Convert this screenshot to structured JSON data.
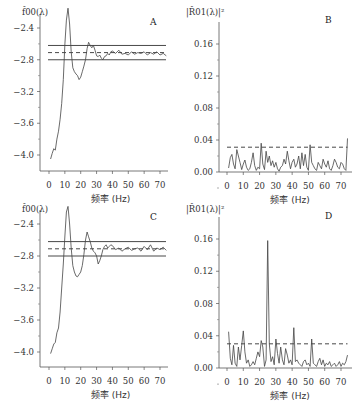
{
  "chart_data": [
    {
      "panel": "A",
      "type": "line",
      "ylabel": "f̂00(λ)",
      "xlabel": "频率 (Hz)",
      "xticks": [
        0,
        10,
        20,
        30,
        40,
        50,
        60,
        70
      ],
      "yticks": [
        -2.4,
        -2.8,
        -3.2,
        -3.6,
        -4.0
      ],
      "ytick_labels": [
        "−2.4",
        "−2.8",
        "−3.2",
        "−3.6",
        "−4.0"
      ],
      "xlim": [
        -2,
        78
      ],
      "ylim": [
        -4.2,
        -2.15
      ],
      "reference_lines": {
        "upper": -2.62,
        "mean": -2.71,
        "lower": -2.8
      },
      "x": [
        1,
        2,
        3,
        4,
        5,
        6,
        7,
        8,
        9,
        10,
        11,
        12,
        13,
        14,
        15,
        16,
        17,
        18,
        19,
        20,
        21,
        22,
        23,
        24,
        25,
        26,
        27,
        28,
        29,
        30,
        31,
        32,
        33,
        34,
        35,
        36,
        37,
        38,
        39,
        40,
        42,
        44,
        46,
        48,
        50,
        52,
        54,
        56,
        58,
        60,
        62,
        64,
        66,
        68,
        70,
        72,
        74
      ],
      "values": [
        -4.05,
        -3.98,
        -3.92,
        -3.94,
        -3.8,
        -3.7,
        -3.55,
        -3.35,
        -3.05,
        -2.6,
        -2.3,
        -2.15,
        -2.35,
        -2.7,
        -2.9,
        -2.95,
        -2.98,
        -3.0,
        -3.05,
        -3.02,
        -2.95,
        -2.88,
        -2.8,
        -2.66,
        -2.58,
        -2.62,
        -2.65,
        -2.62,
        -2.68,
        -2.75,
        -2.76,
        -2.74,
        -2.78,
        -2.8,
        -2.76,
        -2.75,
        -2.72,
        -2.74,
        -2.7,
        -2.69,
        -2.72,
        -2.68,
        -2.73,
        -2.72,
        -2.74,
        -2.7,
        -2.73,
        -2.71,
        -2.72,
        -2.7,
        -2.74,
        -2.71,
        -2.73,
        -2.7,
        -2.74,
        -2.72,
        -2.75
      ]
    },
    {
      "panel": "B",
      "type": "line",
      "ylabel": "|R̂01(λ)|²",
      "xlabel": "频率 (Hz)",
      "xticks": [
        0,
        10,
        20,
        30,
        40,
        50,
        60,
        70
      ],
      "yticks": [
        0.0,
        0.04,
        0.08,
        0.12,
        0.16
      ],
      "ytick_labels": [
        "0.00",
        "0.04",
        "0.08",
        "0.12",
        "0.16"
      ],
      "xlim": [
        -2,
        78
      ],
      "ylim": [
        0,
        0.18
      ],
      "threshold": 0.031,
      "x": [
        1,
        2,
        3,
        4,
        5,
        6,
        7,
        8,
        9,
        10,
        11,
        12,
        13,
        14,
        15,
        16,
        17,
        18,
        19,
        20,
        21,
        22,
        23,
        24,
        25,
        26,
        27,
        28,
        29,
        30,
        31,
        32,
        33,
        34,
        35,
        36,
        37,
        38,
        39,
        40,
        41,
        42,
        43,
        44,
        45,
        46,
        47,
        48,
        49,
        50,
        51,
        52,
        53,
        54,
        55,
        56,
        57,
        58,
        59,
        60,
        61,
        62,
        63,
        64,
        65,
        66,
        67,
        68,
        69,
        70,
        71,
        72,
        73,
        74
      ],
      "values": [
        0.005,
        0.018,
        0.022,
        0.01,
        0.004,
        0.028,
        0.02,
        0.012,
        0.003,
        0.01,
        0.015,
        0.006,
        0.002,
        0.004,
        0.012,
        0.024,
        0.008,
        0.002,
        0.006,
        0.004,
        0.036,
        0.01,
        0.003,
        0.026,
        0.012,
        0.02,
        0.008,
        0.014,
        0.006,
        0.012,
        0.004,
        0.001,
        0.006,
        0.008,
        0.016,
        0.01,
        0.026,
        0.014,
        0.004,
        0.012,
        0.016,
        0.006,
        0.01,
        0.02,
        0.004,
        0.024,
        0.008,
        0.022,
        0.006,
        0.002,
        0.034,
        0.012,
        0.008,
        0.004,
        0.002,
        0.012,
        0.008,
        0.004,
        0.016,
        0.01,
        0.006,
        0.014,
        0.004,
        0.002,
        0.008,
        0.016,
        0.012,
        0.006,
        0.004,
        0.012,
        0.01,
        0.004,
        0.002,
        0.042
      ]
    },
    {
      "panel": "C",
      "type": "line",
      "ylabel": "f̂00(λ)",
      "xlabel": "频率 (Hz)",
      "xticks": [
        0,
        10,
        20,
        30,
        40,
        50,
        60,
        70
      ],
      "yticks": [
        -2.4,
        -2.8,
        -3.2,
        -3.6,
        -4.0
      ],
      "ytick_labels": [
        "−2.4",
        "−2.8",
        "−3.2",
        "−3.6",
        "−4.0"
      ],
      "xlim": [
        -2,
        78
      ],
      "ylim": [
        -4.2,
        -2.15
      ],
      "reference_lines": {
        "upper": -2.62,
        "mean": -2.71,
        "lower": -2.8
      },
      "x": [
        1,
        2,
        3,
        4,
        5,
        6,
        7,
        8,
        9,
        10,
        11,
        12,
        13,
        14,
        15,
        16,
        17,
        18,
        19,
        20,
        21,
        22,
        23,
        24,
        25,
        26,
        27,
        28,
        29,
        30,
        31,
        32,
        33,
        34,
        35,
        36,
        37,
        38,
        39,
        40,
        42,
        44,
        46,
        48,
        50,
        52,
        54,
        56,
        58,
        60,
        62,
        64,
        66,
        68,
        70,
        72,
        74
      ],
      "values": [
        -4.02,
        -3.96,
        -3.9,
        -3.88,
        -3.76,
        -3.7,
        -3.5,
        -3.2,
        -2.9,
        -2.55,
        -2.25,
        -2.18,
        -2.4,
        -2.7,
        -2.92,
        -3.0,
        -3.05,
        -3.06,
        -3.03,
        -3.0,
        -2.92,
        -2.78,
        -2.6,
        -2.5,
        -2.56,
        -2.62,
        -2.7,
        -2.74,
        -2.76,
        -2.8,
        -2.9,
        -2.86,
        -2.8,
        -2.72,
        -2.68,
        -2.66,
        -2.7,
        -2.68,
        -2.66,
        -2.67,
        -2.72,
        -2.7,
        -2.74,
        -2.71,
        -2.69,
        -2.73,
        -2.71,
        -2.7,
        -2.74,
        -2.68,
        -2.72,
        -2.66,
        -2.74,
        -2.7,
        -2.72,
        -2.69,
        -2.73
      ]
    },
    {
      "panel": "D",
      "type": "line",
      "ylabel": "|R̂01(λ)|²",
      "xlabel": "频率 (Hz)",
      "xticks": [
        0,
        10,
        20,
        30,
        40,
        50,
        60,
        70
      ],
      "yticks": [
        0.0,
        0.04,
        0.08,
        0.12,
        0.16
      ],
      "ytick_labels": [
        "0.00",
        "0.04",
        "0.08",
        "0.12",
        "0.16"
      ],
      "xlim": [
        -2,
        78
      ],
      "ylim": [
        0,
        0.18
      ],
      "threshold": 0.03,
      "x": [
        1,
        2,
        3,
        4,
        5,
        6,
        7,
        8,
        9,
        10,
        11,
        12,
        13,
        14,
        15,
        16,
        17,
        18,
        19,
        20,
        21,
        22,
        23,
        24,
        25,
        26,
        27,
        28,
        29,
        30,
        31,
        32,
        33,
        34,
        35,
        36,
        37,
        38,
        39,
        40,
        41,
        42,
        43,
        44,
        45,
        46,
        47,
        48,
        49,
        50,
        51,
        52,
        53,
        54,
        55,
        56,
        57,
        58,
        59,
        60,
        61,
        62,
        63,
        64,
        65,
        66,
        67,
        68,
        69,
        70,
        71,
        72,
        73,
        74
      ],
      "values": [
        0.045,
        0.012,
        0.004,
        0.028,
        0.006,
        0.002,
        0.026,
        0.01,
        0.028,
        0.046,
        0.02,
        0.006,
        0.01,
        0.002,
        0.004,
        0.008,
        0.004,
        0.012,
        0.02,
        0.014,
        0.034,
        0.026,
        0.002,
        0.01,
        0.158,
        0.03,
        0.008,
        0.014,
        0.004,
        0.036,
        0.018,
        0.006,
        0.026,
        0.01,
        0.004,
        0.024,
        0.016,
        0.006,
        0.01,
        0.004,
        0.05,
        0.008,
        0.01,
        0.006,
        0.004,
        0.002,
        0.008,
        0.01,
        0.004,
        0.006,
        0.002,
        0.036,
        0.006,
        0.004,
        0.002,
        0.008,
        0.012,
        0.004,
        0.01,
        0.002,
        0.006,
        0.004,
        0.008,
        0.002,
        0.004,
        0.006,
        0.002,
        0.004,
        0.008,
        0.002,
        0.006,
        0.004,
        0.008,
        0.016
      ]
    }
  ]
}
